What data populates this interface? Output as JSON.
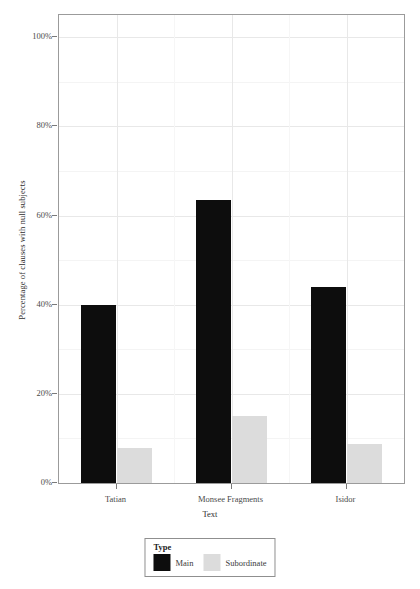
{
  "chart_data": {
    "type": "bar",
    "title": "",
    "xlabel": "Text",
    "ylabel": "Percentage of clauses with null subjects",
    "categories": [
      "Tatian",
      "Monsee Fragments",
      "Isidor"
    ],
    "series": [
      {
        "name": "Main",
        "color": "#0d0d0d",
        "values": [
          40,
          63.5,
          44
        ]
      },
      {
        "name": "Subordinate",
        "color": "#dcdcdc",
        "values": [
          7.8,
          15,
          8.7
        ]
      }
    ],
    "ylim": [
      0,
      105
    ],
    "ytick_values": [
      0,
      20,
      40,
      60,
      80,
      100
    ],
    "ytick_labels": [
      "0%",
      "20%",
      "40%",
      "60%",
      "80%",
      "100%"
    ],
    "yminor_values": [
      10,
      30,
      50,
      70,
      90
    ],
    "grid": true,
    "legend": {
      "title": "Type",
      "position": "bottom",
      "entries": [
        {
          "label": "Main",
          "color": "#0d0d0d"
        },
        {
          "label": "Subordinate",
          "color": "#dcdcdc"
        }
      ]
    }
  }
}
